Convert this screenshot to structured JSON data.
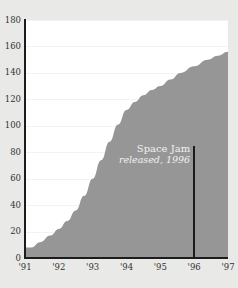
{
  "chart_data": {
    "type": "area",
    "title": "",
    "xlabel": "",
    "ylabel": "",
    "grid": true,
    "legend": "none",
    "xlim": [
      1991,
      1997
    ],
    "ylim": [
      0,
      180
    ],
    "x": [
      1991,
      1997
    ],
    "categories": [
      "'91",
      "'92",
      "'93",
      "'94",
      "'95",
      "'96",
      "'97"
    ],
    "y_ticks": [
      0,
      20,
      40,
      60,
      80,
      100,
      120,
      140,
      160,
      180
    ],
    "x_tick_labels": [
      "'91",
      "'92",
      "'93",
      "'94",
      "'95",
      "'96",
      "'97"
    ],
    "series": [
      {
        "name": "cumulative",
        "values": [
          8,
          22,
          60,
          112,
          130,
          145,
          156
        ],
        "points": [
          {
            "x": 1991.0,
            "y": 8
          },
          {
            "x": 1991.18,
            "y": 8
          },
          {
            "x": 1991.45,
            "y": 12
          },
          {
            "x": 1991.75,
            "y": 17
          },
          {
            "x": 1992.0,
            "y": 22
          },
          {
            "x": 1992.25,
            "y": 28
          },
          {
            "x": 1992.5,
            "y": 36
          },
          {
            "x": 1992.75,
            "y": 47
          },
          {
            "x": 1993.0,
            "y": 60
          },
          {
            "x": 1993.25,
            "y": 74
          },
          {
            "x": 1993.5,
            "y": 88
          },
          {
            "x": 1993.75,
            "y": 101
          },
          {
            "x": 1994.0,
            "y": 112
          },
          {
            "x": 1994.25,
            "y": 118
          },
          {
            "x": 1994.5,
            "y": 123
          },
          {
            "x": 1994.75,
            "y": 127
          },
          {
            "x": 1995.0,
            "y": 130
          },
          {
            "x": 1995.3,
            "y": 135
          },
          {
            "x": 1995.6,
            "y": 140
          },
          {
            "x": 1996.0,
            "y": 145
          },
          {
            "x": 1996.4,
            "y": 150
          },
          {
            "x": 1996.7,
            "y": 153
          },
          {
            "x": 1997.0,
            "y": 156
          }
        ]
      }
    ],
    "annotations": [
      {
        "title": "Space Jam",
        "subtitle": "released, 1996",
        "x": 1996,
        "y_top": 85,
        "y_bottom": 0
      }
    ],
    "colors": {
      "area_fill": "#969696",
      "axis": "#1c1c1c",
      "grid": "#f4f3f1",
      "plot_background": "#ffffff",
      "page_background": "#e9e9e7",
      "tick_label": "#333333",
      "annotation_text": "#f2f2f2"
    }
  }
}
